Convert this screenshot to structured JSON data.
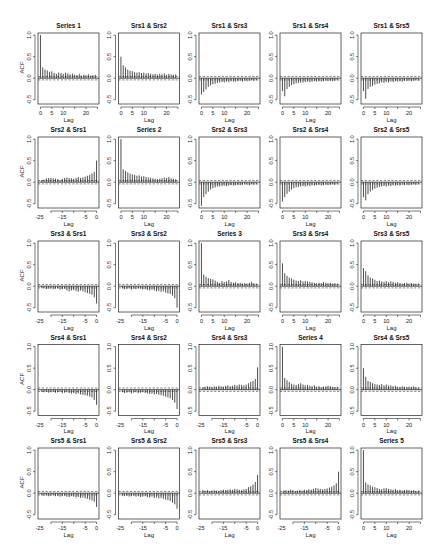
{
  "chart_data": {
    "type": "bar",
    "title": "",
    "layout": {
      "rows": 5,
      "cols": 5
    },
    "xlabel": "Lag",
    "ylabel": "ACF",
    "ylim": [
      -0.6,
      1.05
    ],
    "yticks": [
      -0.5,
      0.0,
      0.5,
      1.0
    ],
    "ytick_labels": [
      "-0.5",
      "0.0",
      "0.5",
      "1.0"
    ],
    "confidence_band": 0.04,
    "positive_lag_xticks": [
      0,
      5,
      10,
      20
    ],
    "positive_lag_xtick_labels": [
      "0",
      "5",
      "10",
      "20"
    ],
    "negative_lag_xticks": [
      -25,
      -15,
      -5,
      0
    ],
    "negative_lag_xtick_labels": [
      "-25",
      "-15",
      "-5",
      "0"
    ],
    "panels": [
      {
        "row": 0,
        "col": 0,
        "title": "Series 1",
        "lag_direction": "positive",
        "values": [
          1.0,
          0.25,
          0.2,
          0.18,
          0.15,
          0.16,
          0.12,
          0.1,
          0.13,
          0.12,
          0.1,
          0.13,
          0.11,
          0.09,
          0.11,
          0.08,
          0.07,
          0.1,
          0.06,
          0.08,
          0.07,
          0.09,
          0.06,
          0.07,
          0.08
        ]
      },
      {
        "row": 0,
        "col": 1,
        "title": "Srs1 & Srs2",
        "lag_direction": "positive",
        "values": [
          0.5,
          0.3,
          0.25,
          0.2,
          0.17,
          0.16,
          0.14,
          0.13,
          0.14,
          0.12,
          0.13,
          0.11,
          0.12,
          0.1,
          0.09,
          0.1,
          0.08,
          0.1,
          0.09,
          0.11,
          0.08,
          0.1,
          0.09,
          0.08,
          0.09
        ]
      },
      {
        "row": 0,
        "col": 2,
        "title": "Srs1 & Srs3",
        "lag_direction": "positive",
        "values": [
          -0.38,
          -0.32,
          -0.26,
          -0.2,
          -0.17,
          -0.14,
          -0.13,
          -0.11,
          -0.1,
          -0.09,
          -0.1,
          -0.08,
          -0.09,
          -0.07,
          -0.08,
          -0.08,
          -0.07,
          -0.06,
          -0.08,
          -0.06,
          -0.07,
          -0.06,
          -0.05,
          -0.06,
          -0.05
        ]
      },
      {
        "row": 0,
        "col": 3,
        "title": "Srs1 & Srs4",
        "lag_direction": "positive",
        "values": [
          -0.3,
          -0.42,
          -0.25,
          -0.2,
          -0.16,
          -0.14,
          -0.12,
          -0.11,
          -0.1,
          -0.1,
          -0.09,
          -0.08,
          -0.09,
          -0.08,
          -0.07,
          -0.08,
          -0.07,
          -0.08,
          -0.07,
          -0.06,
          -0.07,
          -0.06,
          -0.07,
          -0.06,
          -0.05
        ]
      },
      {
        "row": 0,
        "col": 4,
        "title": "Srs1 & Srs5",
        "lag_direction": "positive",
        "values": [
          -0.3,
          -0.48,
          -0.25,
          -0.2,
          -0.18,
          -0.15,
          -0.13,
          -0.12,
          -0.1,
          -0.11,
          -0.09,
          -0.1,
          -0.08,
          -0.09,
          -0.07,
          -0.08,
          -0.07,
          -0.08,
          -0.06,
          -0.07,
          -0.06,
          -0.07,
          -0.06,
          -0.05,
          -0.06
        ]
      },
      {
        "row": 1,
        "col": 0,
        "title": "Srs2 & Srs1",
        "lag_direction": "negative",
        "values": [
          0.05,
          0.06,
          0.09,
          0.1,
          0.1,
          0.09,
          0.08,
          0.07,
          0.05,
          0.08,
          0.1,
          0.11,
          0.1,
          0.09,
          0.08,
          0.1,
          0.12,
          0.1,
          0.11,
          0.13,
          0.15,
          0.17,
          0.2,
          0.24,
          0.5
        ]
      },
      {
        "row": 1,
        "col": 1,
        "title": "Series 2",
        "lag_direction": "positive",
        "values": [
          1.0,
          0.3,
          0.26,
          0.23,
          0.2,
          0.18,
          0.17,
          0.15,
          0.16,
          0.13,
          0.14,
          0.12,
          0.11,
          0.1,
          0.09,
          0.08,
          0.07,
          0.08,
          0.09,
          0.11,
          0.1,
          0.12,
          0.09,
          0.08,
          0.07
        ]
      },
      {
        "row": 1,
        "col": 2,
        "title": "Srs2 & Srs3",
        "lag_direction": "positive",
        "values": [
          -0.55,
          -0.35,
          -0.28,
          -0.22,
          -0.17,
          -0.14,
          -0.12,
          -0.1,
          -0.1,
          -0.09,
          -0.08,
          -0.09,
          -0.08,
          -0.07,
          -0.08,
          -0.07,
          -0.06,
          -0.07,
          -0.06,
          -0.05,
          -0.06,
          -0.07,
          -0.05,
          -0.06,
          -0.05
        ]
      },
      {
        "row": 1,
        "col": 3,
        "title": "Srs2 & Srs4",
        "lag_direction": "positive",
        "values": [
          -0.45,
          -0.35,
          -0.27,
          -0.22,
          -0.17,
          -0.14,
          -0.12,
          -0.11,
          -0.1,
          -0.09,
          -0.1,
          -0.08,
          -0.09,
          -0.07,
          -0.08,
          -0.07,
          -0.06,
          -0.08,
          -0.07,
          -0.06,
          -0.07,
          -0.06,
          -0.05,
          -0.06,
          -0.05
        ]
      },
      {
        "row": 1,
        "col": 4,
        "title": "Srs2 & Srs5",
        "lag_direction": "positive",
        "values": [
          -0.35,
          -0.42,
          -0.28,
          -0.22,
          -0.18,
          -0.15,
          -0.13,
          -0.11,
          -0.1,
          -0.09,
          -0.1,
          -0.08,
          -0.09,
          -0.07,
          -0.08,
          -0.07,
          -0.08,
          -0.06,
          -0.07,
          -0.06,
          -0.07,
          -0.06,
          -0.05,
          -0.06,
          -0.05
        ]
      },
      {
        "row": 2,
        "col": 0,
        "title": "Srs3 & Srs1",
        "lag_direction": "negative",
        "values": [
          -0.04,
          -0.05,
          -0.07,
          -0.06,
          -0.05,
          -0.07,
          -0.06,
          -0.05,
          -0.08,
          -0.07,
          -0.06,
          -0.1,
          -0.12,
          -0.1,
          -0.09,
          -0.11,
          -0.13,
          -0.1,
          -0.12,
          -0.14,
          -0.16,
          -0.18,
          -0.2,
          -0.26,
          -0.4
        ]
      },
      {
        "row": 2,
        "col": 1,
        "title": "Srs3 & Srs2",
        "lag_direction": "negative",
        "values": [
          -0.05,
          -0.07,
          -0.06,
          -0.05,
          -0.08,
          -0.06,
          -0.07,
          -0.05,
          -0.06,
          -0.08,
          -0.07,
          -0.09,
          -0.1,
          -0.08,
          -0.1,
          -0.12,
          -0.11,
          -0.13,
          -0.12,
          -0.15,
          -0.17,
          -0.18,
          -0.22,
          -0.28,
          -0.5
        ]
      },
      {
        "row": 2,
        "col": 2,
        "title": "Series 3",
        "lag_direction": "positive",
        "values": [
          1.0,
          0.27,
          0.22,
          0.19,
          0.17,
          0.16,
          0.13,
          0.1,
          0.08,
          0.12,
          0.1,
          0.11,
          0.14,
          0.1,
          0.08,
          0.09,
          0.07,
          0.08,
          0.06,
          0.07,
          0.06,
          0.08,
          0.1,
          0.07,
          0.06
        ]
      },
      {
        "row": 2,
        "col": 3,
        "title": "Srs3 & Srs4",
        "lag_direction": "positive",
        "values": [
          0.53,
          0.3,
          0.24,
          0.2,
          0.18,
          0.15,
          0.13,
          0.12,
          0.14,
          0.11,
          0.12,
          0.11,
          0.1,
          0.09,
          0.08,
          0.07,
          0.08,
          0.07,
          0.09,
          0.08,
          0.07,
          0.08,
          0.06,
          0.07,
          0.06
        ]
      },
      {
        "row": 2,
        "col": 4,
        "title": "Srs3 & Srs5",
        "lag_direction": "positive",
        "values": [
          0.42,
          0.35,
          0.25,
          0.2,
          0.18,
          0.15,
          0.12,
          0.13,
          0.11,
          0.1,
          0.12,
          0.09,
          0.11,
          0.1,
          0.08,
          0.09,
          0.07,
          0.06,
          0.07,
          0.08,
          0.06,
          0.07,
          0.06,
          0.05,
          0.06
        ]
      },
      {
        "row": 3,
        "col": 0,
        "title": "Srs4 & Srs1",
        "lag_direction": "negative",
        "values": [
          -0.05,
          -0.06,
          -0.05,
          -0.07,
          -0.06,
          -0.05,
          -0.07,
          -0.06,
          -0.05,
          -0.08,
          -0.07,
          -0.06,
          -0.08,
          -0.09,
          -0.08,
          -0.1,
          -0.09,
          -0.11,
          -0.12,
          -0.13,
          -0.14,
          -0.16,
          -0.18,
          -0.24,
          -0.35
        ]
      },
      {
        "row": 3,
        "col": 1,
        "title": "Srs4 & Srs2",
        "lag_direction": "negative",
        "values": [
          -0.06,
          -0.08,
          -0.07,
          -0.06,
          -0.09,
          -0.07,
          -0.06,
          -0.08,
          -0.07,
          -0.06,
          -0.08,
          -0.09,
          -0.1,
          -0.09,
          -0.11,
          -0.1,
          -0.12,
          -0.13,
          -0.14,
          -0.16,
          -0.18,
          -0.2,
          -0.24,
          -0.3,
          -0.45
        ]
      },
      {
        "row": 3,
        "col": 2,
        "title": "Srs4 & Srs3",
        "lag_direction": "negative",
        "values": [
          0.06,
          0.07,
          0.08,
          0.07,
          0.06,
          0.08,
          0.07,
          0.09,
          0.08,
          0.07,
          0.09,
          0.1,
          0.08,
          0.09,
          0.11,
          0.1,
          0.12,
          0.11,
          0.1,
          0.12,
          0.15,
          0.18,
          0.2,
          0.25,
          0.52
        ]
      },
      {
        "row": 3,
        "col": 3,
        "title": "Series 4",
        "lag_direction": "positive",
        "values": [
          1.0,
          0.27,
          0.22,
          0.18,
          0.14,
          0.12,
          0.11,
          0.13,
          0.15,
          0.12,
          0.1,
          0.11,
          0.09,
          0.08,
          0.1,
          0.07,
          0.08,
          0.06,
          0.07,
          0.08,
          0.09,
          0.08,
          0.07,
          0.06,
          0.07
        ]
      },
      {
        "row": 3,
        "col": 4,
        "title": "Srs4 & Srs5",
        "lag_direction": "positive",
        "values": [
          0.5,
          0.3,
          0.2,
          0.18,
          0.15,
          0.13,
          0.12,
          0.11,
          0.13,
          0.1,
          0.12,
          0.09,
          0.1,
          0.08,
          0.09,
          0.07,
          0.06,
          0.08,
          0.07,
          0.06,
          0.07,
          0.06,
          0.08,
          0.06,
          0.05
        ]
      },
      {
        "row": 4,
        "col": 0,
        "title": "Srs5 & Srs1",
        "lag_direction": "negative",
        "values": [
          -0.05,
          -0.06,
          -0.05,
          -0.07,
          -0.06,
          -0.05,
          -0.07,
          -0.06,
          -0.08,
          -0.07,
          -0.06,
          -0.08,
          -0.09,
          -0.07,
          -0.08,
          -0.1,
          -0.09,
          -0.11,
          -0.1,
          -0.12,
          -0.13,
          -0.15,
          -0.17,
          -0.2,
          -0.32
        ]
      },
      {
        "row": 4,
        "col": 1,
        "title": "Srs5 & Srs2",
        "lag_direction": "negative",
        "values": [
          -0.06,
          -0.07,
          -0.06,
          -0.08,
          -0.07,
          -0.06,
          -0.08,
          -0.07,
          -0.09,
          -0.08,
          -0.07,
          -0.09,
          -0.1,
          -0.08,
          -0.11,
          -0.1,
          -0.12,
          -0.11,
          -0.13,
          -0.15,
          -0.16,
          -0.18,
          -0.22,
          -0.26,
          -0.36
        ]
      },
      {
        "row": 4,
        "col": 2,
        "title": "Srs5 & Srs3",
        "lag_direction": "negative",
        "values": [
          0.07,
          0.06,
          0.07,
          0.05,
          0.06,
          0.07,
          0.06,
          0.05,
          0.07,
          0.08,
          0.07,
          0.08,
          0.09,
          0.08,
          0.1,
          0.09,
          0.08,
          0.07,
          0.09,
          0.1,
          0.14,
          0.16,
          0.2,
          0.26,
          0.42
        ]
      },
      {
        "row": 4,
        "col": 3,
        "title": "Srs5 & Srs4",
        "lag_direction": "negative",
        "values": [
          0.06,
          0.07,
          0.06,
          0.08,
          0.07,
          0.05,
          0.06,
          0.07,
          0.06,
          0.08,
          0.07,
          0.09,
          0.08,
          0.1,
          0.12,
          0.11,
          0.1,
          0.09,
          0.1,
          0.11,
          0.13,
          0.15,
          0.18,
          0.23,
          0.5
        ]
      },
      {
        "row": 4,
        "col": 4,
        "title": "Series 5",
        "lag_direction": "positive",
        "values": [
          1.0,
          0.25,
          0.2,
          0.18,
          0.15,
          0.14,
          0.12,
          0.1,
          0.09,
          0.11,
          0.12,
          0.1,
          0.09,
          0.08,
          0.1,
          0.07,
          0.08,
          0.06,
          0.07,
          0.08,
          0.07,
          0.06,
          0.07,
          0.05,
          0.06
        ]
      }
    ]
  },
  "layout_hints": {
    "col_box_left": [
      38,
      118.5,
      199,
      280,
      361
    ],
    "row_box_top": [
      33,
      137,
      241,
      344.5,
      448
    ],
    "box_width": 61,
    "box_height": 71,
    "show_ylabel_col": 0
  }
}
